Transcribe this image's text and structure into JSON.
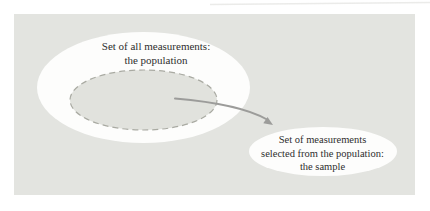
{
  "figure": {
    "population_label": {
      "line1": "Set of all measurements:",
      "line2": "the population"
    },
    "sample_label": {
      "line1": "Set of measurements",
      "line2": "selected from the population:",
      "line3": "the sample"
    },
    "colors": {
      "panel_background": "#e3e4e0",
      "ellipse_fill": "#fdfdfc",
      "subset_fill": "#e1e2dd",
      "subset_dash_stroke": "#a9aaa2",
      "arrow": "#9c9c9a",
      "text": "#2e2e2e"
    }
  }
}
